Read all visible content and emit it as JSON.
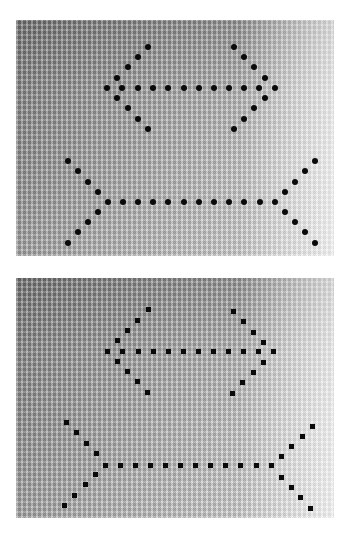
{
  "figure": {
    "background": {
      "dark": "#8e8e8e",
      "light": "#ececec"
    },
    "dot_color": "#0a0a0a",
    "panels": [
      {
        "id": "top",
        "rect": {
          "x": 16,
          "y": 20,
          "w": 318,
          "h": 236
        },
        "dot_shape": "round",
        "figures": [
          {
            "name": "arrowheads-figure",
            "shaft": {
              "y": 88,
              "x": [
                107,
                122,
                138,
                153,
                168,
                184,
                199,
                214,
                229,
                244,
                259,
                275
              ]
            },
            "left_head": [
              [
                148,
                47
              ],
              [
                138,
                57
              ],
              [
                128,
                67
              ],
              [
                117,
                78
              ],
              [
                117,
                98
              ],
              [
                128,
                108
              ],
              [
                138,
                119
              ],
              [
                148,
                129
              ]
            ],
            "right_head": [
              [
                234,
                47
              ],
              [
                244,
                57
              ],
              [
                254,
                67
              ],
              [
                265,
                78
              ],
              [
                265,
                98
              ],
              [
                254,
                108
              ],
              [
                244,
                119
              ],
              [
                234,
                129
              ]
            ]
          },
          {
            "name": "fins-figure",
            "shaft": {
              "y": 202,
              "x": [
                108,
                123,
                138,
                153,
                168,
                184,
                199,
                214,
                229,
                244,
                260,
                275
              ]
            },
            "left_head": [
              [
                68,
                161
              ],
              [
                78,
                171
              ],
              [
                88,
                182
              ],
              [
                98,
                192
              ],
              [
                98,
                212
              ],
              [
                88,
                222
              ],
              [
                78,
                232
              ],
              [
                68,
                243
              ]
            ],
            "right_head": [
              [
                315,
                161
              ],
              [
                305,
                171
              ],
              [
                295,
                182
              ],
              [
                285,
                192
              ],
              [
                285,
                212
              ],
              [
                295,
                222
              ],
              [
                305,
                232
              ],
              [
                315,
                243
              ]
            ]
          }
        ]
      },
      {
        "id": "bottom",
        "rect": {
          "x": 16,
          "y": 278,
          "w": 318,
          "h": 240
        },
        "dot_shape": "square",
        "figures": [
          {
            "name": "arrowheads-figure",
            "shaft": {
              "y": 351,
              "x": [
                107,
                122,
                138,
                153,
                168,
                183,
                198,
                213,
                228,
                243,
                258,
                273
              ]
            },
            "left_head": [
              [
                148,
                309
              ],
              [
                137,
                320
              ],
              [
                127,
                330
              ],
              [
                117,
                340
              ],
              [
                117,
                361
              ],
              [
                127,
                371
              ],
              [
                137,
                381
              ],
              [
                147,
                392
              ]
            ],
            "right_head": [
              [
                233,
                311
              ],
              [
                243,
                321
              ],
              [
                253,
                332
              ],
              [
                263,
                342
              ],
              [
                263,
                362
              ],
              [
                253,
                372
              ],
              [
                242,
                382
              ],
              [
                232,
                393
              ]
            ]
          },
          {
            "name": "fins-figure",
            "shaft": {
              "y": 465,
              "x": [
                105,
                120,
                135,
                150,
                165,
                180,
                195,
                210,
                225,
                240,
                256,
                271
              ]
            },
            "left_head": [
              [
                66,
                422
              ],
              [
                76,
                432
              ],
              [
                86,
                443
              ],
              [
                96,
                453
              ],
              [
                95,
                474
              ],
              [
                85,
                484
              ],
              [
                74,
                495
              ],
              [
                64,
                505
              ]
            ],
            "right_head": [
              [
                312,
                426
              ],
              [
                302,
                436
              ],
              [
                291,
                446
              ],
              [
                281,
                456
              ],
              [
                281,
                477
              ],
              [
                291,
                487
              ],
              [
                300,
                497
              ],
              [
                310,
                508
              ]
            ]
          }
        ]
      }
    ]
  }
}
